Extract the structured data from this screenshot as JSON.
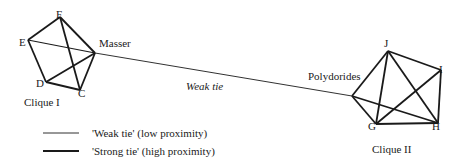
{
  "nodes": {
    "F": "F",
    "E": "E",
    "D": "D",
    "C": "C",
    "masser": "Masser",
    "J": "J",
    "I": "I",
    "G": "G",
    "H": "H",
    "polydorides": "Polydorides"
  },
  "cliques": {
    "one": "Clique I",
    "two": "Clique II"
  },
  "bridge_label": "Weak tie",
  "legend": {
    "weak": "'Weak tie' (low proximity)",
    "strong": "'Strong tie' (high proximity)"
  },
  "colors": {
    "line": "#1a1a1a",
    "background": "#ffffff"
  }
}
